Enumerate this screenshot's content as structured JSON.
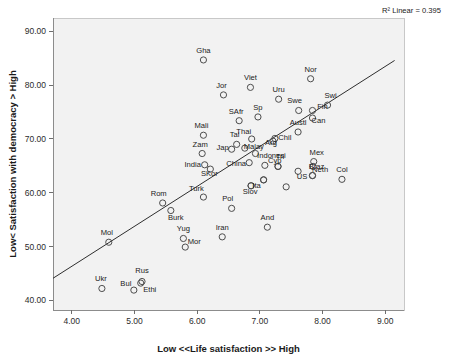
{
  "chart_data": {
    "type": "scatter",
    "title": "",
    "xlabel": "Low <<Life satisfaction >> High",
    "ylabel": "Low< Satisfaction with democracy > High",
    "xlim": [
      3.7,
      9.3
    ],
    "ylim": [
      38.2,
      92.5
    ],
    "xticks": [
      "4.00",
      "5.00",
      "6.00",
      "7.00",
      "8.00",
      "9.00"
    ],
    "xtick_values": [
      4.0,
      5.0,
      6.0,
      7.0,
      8.0,
      9.0
    ],
    "yticks": [
      "40.00",
      "50.00",
      "60.00",
      "70.00",
      "80.00",
      "90.00"
    ],
    "ytick_values": [
      40,
      50,
      60,
      70,
      80,
      90
    ],
    "grid": false,
    "legend": "none",
    "annotation": "R² Linear = 0.395",
    "r_squared": 0.395,
    "marker": "open-circle",
    "fit_line": {
      "x": [
        3.7,
        9.15
      ],
      "y": [
        44.1,
        84.6
      ]
    },
    "points": [
      {
        "label": "Gha",
        "x": 6.1,
        "y": 84.7,
        "lx": 0,
        "ly": -7
      },
      {
        "label": "Nor",
        "x": 7.81,
        "y": 81.2,
        "lx": 0,
        "ly": -7
      },
      {
        "label": "Viet",
        "x": 6.85,
        "y": 79.6,
        "lx": 0,
        "ly": -7
      },
      {
        "label": "Jor",
        "x": 6.42,
        "y": 78.2,
        "lx": -2,
        "ly": -7
      },
      {
        "label": "Uru",
        "x": 7.3,
        "y": 77.4,
        "lx": 0,
        "ly": -7
      },
      {
        "label": "Swi",
        "x": 8.08,
        "y": 76.3,
        "lx": 3,
        "ly": -7
      },
      {
        "label": "Fin",
        "x": 7.84,
        "y": 75.3,
        "lx": 10,
        "ly": -1
      },
      {
        "label": "Swe",
        "x": 7.62,
        "y": 75.3,
        "lx": -4,
        "ly": -7
      },
      {
        "label": "Sp",
        "x": 6.97,
        "y": 74.1,
        "lx": 0,
        "ly": -7
      },
      {
        "label": "Can",
        "x": 7.84,
        "y": 73.9,
        "lx": 6,
        "ly": 5
      },
      {
        "label": "SAfr",
        "x": 6.67,
        "y": 73.4,
        "lx": -3,
        "ly": -7
      },
      {
        "label": "Austl",
        "x": 7.61,
        "y": 71.3,
        "lx": 0,
        "ly": -7
      },
      {
        "label": "Mali",
        "x": 6.1,
        "y": 70.7,
        "lx": -2,
        "ly": -7
      },
      {
        "label": "Can2",
        "x": 7.85,
        "y": 70.7,
        "lx": 99,
        "ly": 99
      },
      {
        "label": "Thai",
        "x": 6.87,
        "y": 70.0,
        "lx": -8,
        "ly": -5
      },
      {
        "label": "Chil",
        "x": 7.24,
        "y": 70.1,
        "lx": 10,
        "ly": 2
      },
      {
        "label": "Arg",
        "x": 7.21,
        "y": 69.6,
        "lx": -2,
        "ly": 4
      },
      {
        "label": "Tai",
        "x": 6.63,
        "y": 69.0,
        "lx": -2,
        "ly": -7
      },
      {
        "label": "Malay",
        "x": 6.76,
        "y": 68.3,
        "lx": 9,
        "ly": 1
      },
      {
        "label": "Jap",
        "x": 6.55,
        "y": 68.1,
        "lx": -9,
        "ly": 1
      },
      {
        "label": "Zam",
        "x": 6.08,
        "y": 67.3,
        "lx": -2,
        "ly": -7
      },
      {
        "label": "Indonesi",
        "x": 6.93,
        "y": 67.3,
        "lx": 16,
        "ly": 4
      },
      {
        "label": "Mex",
        "x": 7.86,
        "y": 65.8,
        "lx": 3,
        "ly": -7
      },
      {
        "label": "China",
        "x": 6.83,
        "y": 65.6,
        "lx": -13,
        "ly": 3
      },
      {
        "label": "Cyp",
        "x": 7.08,
        "y": 65.1,
        "lx": 10,
        "ly": -2
      },
      {
        "label": "Tri",
        "x": 7.29,
        "y": 64.9,
        "lx": 99,
        "ly": 99
      },
      {
        "label": "India",
        "x": 6.12,
        "y": 65.2,
        "lx": -12,
        "ly": 2
      },
      {
        "label": "SKor",
        "x": 6.21,
        "y": 64.4,
        "lx": -1,
        "ly": 7
      },
      {
        "label": "Neth",
        "x": 7.85,
        "y": 64.9,
        "lx": 7,
        "ly": 6
      },
      {
        "label": "US",
        "x": 7.61,
        "y": 64.0,
        "lx": 4,
        "ly": 8
      },
      {
        "label": "Col",
        "x": 8.31,
        "y": 62.5,
        "lx": 0,
        "ly": -7
      },
      {
        "label": "Braz",
        "x": 7.84,
        "y": 63.2,
        "lx": 99,
        "ly": 99
      },
      {
        "label": "Ita",
        "x": 7.06,
        "y": 62.4,
        "lx": 99,
        "ly": 99
      },
      {
        "label": "Slov",
        "x": 6.86,
        "y": 61.3,
        "lx": 99,
        "ly": 99
      },
      {
        "label": "Braz2",
        "x": 7.42,
        "y": 61.1,
        "lx": 99,
        "ly": 99
      },
      {
        "label": "Turk",
        "x": 6.1,
        "y": 59.2,
        "lx": -7,
        "ly": -6
      },
      {
        "label": "Rom",
        "x": 5.45,
        "y": 58.1,
        "lx": -4,
        "ly": -7
      },
      {
        "label": "Slov2",
        "x": 6.84,
        "y": 58.2,
        "lx": 99,
        "ly": 99
      },
      {
        "label": "Ita2",
        "x": 7.09,
        "y": 57.7,
        "lx": 99,
        "ly": 99
      },
      {
        "label": "Pol",
        "x": 6.55,
        "y": 57.1,
        "lx": -4,
        "ly": -7
      },
      {
        "label": "Burk",
        "x": 5.58,
        "y": 56.7,
        "lx": 5,
        "ly": 9
      },
      {
        "label": "And",
        "x": 7.12,
        "y": 53.6,
        "lx": 0,
        "ly": -7
      },
      {
        "label": "Iran",
        "x": 6.4,
        "y": 51.8,
        "lx": 0,
        "ly": -7
      },
      {
        "label": "Yug",
        "x": 5.78,
        "y": 51.5,
        "lx": 0,
        "ly": -7
      },
      {
        "label": "Mol",
        "x": 4.59,
        "y": 50.8,
        "lx": -2,
        "ly": -7
      },
      {
        "label": "Mor",
        "x": 5.81,
        "y": 49.9,
        "lx": 9,
        "ly": -3
      },
      {
        "label": "Rus",
        "x": 5.12,
        "y": 43.5,
        "lx": 0,
        "ly": -8
      },
      {
        "label": "Ethi",
        "x": 5.1,
        "y": 43.2,
        "lx": 9,
        "ly": 9
      },
      {
        "label": "Ukr",
        "x": 4.48,
        "y": 42.2,
        "lx": -1,
        "ly": -7
      },
      {
        "label": "Bul",
        "x": 4.99,
        "y": 41.9,
        "lx": -8,
        "ly": -4
      }
    ],
    "extra_points": [
      {
        "x": 7.29,
        "y": 64.9,
        "label": "Tri",
        "lx": 2,
        "ly": -7
      },
      {
        "x": 7.84,
        "y": 63.2,
        "label": "Braz",
        "lx": 4,
        "ly": -7
      },
      {
        "x": 7.06,
        "y": 62.4,
        "label": "Ita",
        "lx": -7,
        "ly": 8
      },
      {
        "x": 6.86,
        "y": 61.3,
        "label": "Slov",
        "lx": -1,
        "ly": 8
      },
      {
        "x": 7.42,
        "y": 61.1,
        "label": "US",
        "lx": 99,
        "ly": 99
      }
    ]
  }
}
